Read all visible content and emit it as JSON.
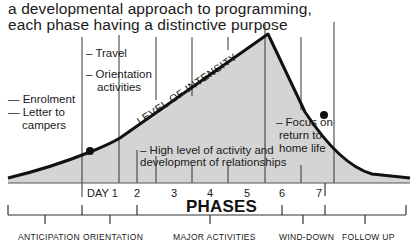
{
  "title": {
    "line1": "a developmental approach to programming,",
    "line2": "each phase having a distinctive purpose"
  },
  "curve_label": "LEVEL OF INTENSITY",
  "annotations": {
    "enrolment": "— Enrolment",
    "letter1": "— Letter to",
    "letter2": "campers",
    "travel": "– Travel",
    "orient1": "– Orientation",
    "orient2": "activities",
    "high1": "– High level of activity and",
    "high2": "development of relationships",
    "focus1": "– Focus on",
    "focus2": "return to",
    "focus3": "home life"
  },
  "days": [
    "DAY 1",
    "2",
    "3",
    "4",
    "5",
    "6",
    "7"
  ],
  "axis_title": "PHASES",
  "phases": [
    "ANTICIPATION",
    "ORIENTATION",
    "MAJOR ACTIVITIES",
    "WIND-DOWN",
    "FOLLOW UP"
  ],
  "colors": {
    "fill": "#d4d4d4",
    "line": "#111111",
    "text": "#1a1a1a"
  }
}
